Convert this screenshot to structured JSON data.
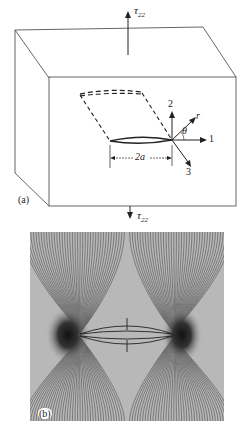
{
  "figure": {
    "panel_a": {
      "label": "(a)",
      "stress_top": "τ",
      "stress_top_sub": "22",
      "stress_bottom": "τ",
      "stress_bottom_sub": "22",
      "axes": {
        "axis2": "2",
        "axis1": "1",
        "axis3": "3",
        "r": "r",
        "theta": "θ"
      },
      "crack_length": "2a"
    },
    "panel_b": {
      "label": "(b)",
      "description": "Photoelastic isochromatic fringe pattern around a crack under tension"
    }
  }
}
